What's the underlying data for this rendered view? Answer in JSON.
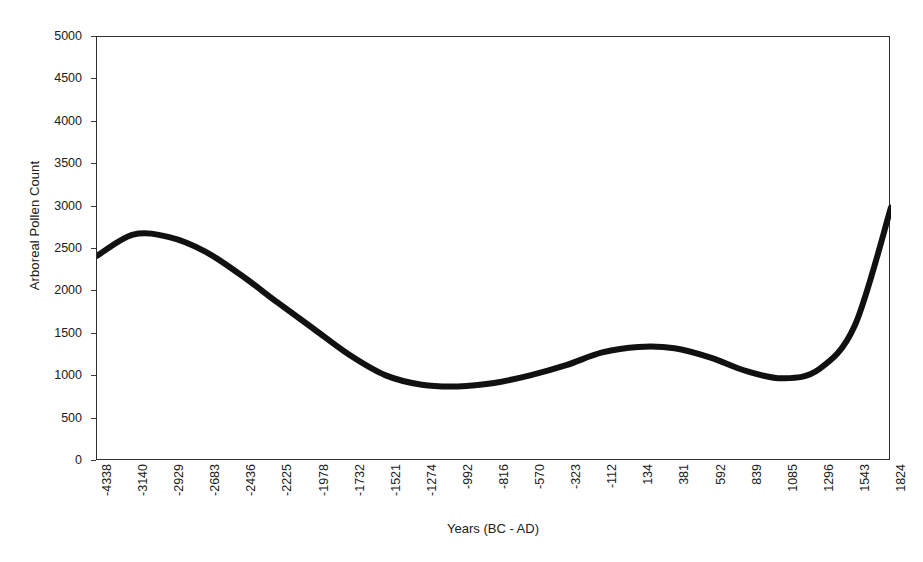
{
  "chart_data": {
    "type": "line",
    "title": "",
    "xlabel": "Years (BC - AD)",
    "ylabel": "Arboreal Pollen Count",
    "grid": false,
    "legend": "none",
    "ylim": [
      0,
      5000
    ],
    "y_ticks": [
      0,
      500,
      1000,
      1500,
      2000,
      2500,
      3000,
      3500,
      4000,
      4500,
      5000
    ],
    "y_tick_labels": [
      "0",
      "500",
      "1000",
      "1500",
      "2000",
      "2500",
      "3000",
      "3500",
      "4000",
      "4500",
      "5000"
    ],
    "categories": [
      "-4338",
      "-3140",
      "-2929",
      "-2683",
      "-2436",
      "-2225",
      "-1978",
      "-1732",
      "-1521",
      "-1274",
      "-992",
      "-816",
      "-570",
      "-323",
      "-112",
      "134",
      "381",
      "592",
      "839",
      "1085",
      "1296",
      "1543",
      "1824"
    ],
    "series": [
      {
        "name": "Arboreal Pollen Count",
        "color": "#111111",
        "values": [
          2420,
          2670,
          2640,
          2470,
          2190,
          1870,
          1560,
          1250,
          1010,
          900,
          880,
          920,
          1010,
          1130,
          1280,
          1345,
          1330,
          1220,
          1060,
          975,
          1080,
          1600,
          2990
        ]
      }
    ],
    "annotations": []
  },
  "axis": {
    "y_title": "Arboreal Pollen Count",
    "x_title": "Years (BC - AD)"
  },
  "style": {
    "line_color": "#111111",
    "frame_color": "#2e2e2e",
    "background": "#ffffff",
    "text_color": "#202020"
  }
}
